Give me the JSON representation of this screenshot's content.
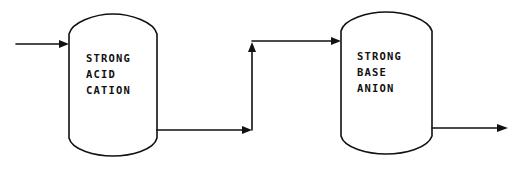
{
  "diagram": {
    "type": "process-flow",
    "vessels": [
      {
        "id": "vessel-1",
        "label_lines": [
          "STRONG",
          "ACID",
          "CATION"
        ]
      },
      {
        "id": "vessel-2",
        "label_lines": [
          "STRONG",
          "BASE",
          "ANION"
        ]
      }
    ],
    "flows": [
      {
        "from": "inlet",
        "to": "vessel-1"
      },
      {
        "from": "vessel-1",
        "to": "vessel-2"
      },
      {
        "from": "vessel-2",
        "to": "outlet"
      }
    ],
    "colors": {
      "line": "#111111",
      "background": "#ffffff"
    }
  }
}
